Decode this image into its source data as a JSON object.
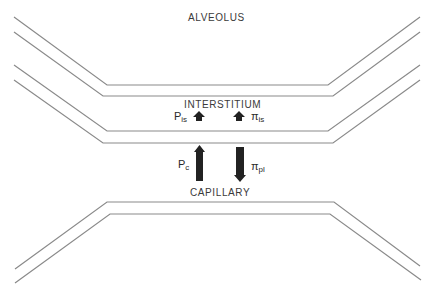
{
  "diagram": {
    "regions": {
      "alveolus": "ALVEOLUS",
      "interstitium": "INTERSTITIUM",
      "capillary": "CAPILLARY"
    },
    "forces": [
      {
        "symbol": "P",
        "subscript": "is",
        "direction": "up",
        "location": "interstitium",
        "arrow_size": "small"
      },
      {
        "symbol": "π",
        "subscript": "is",
        "direction": "up",
        "location": "interstitium",
        "arrow_size": "small"
      },
      {
        "symbol": "P",
        "subscript": "c",
        "direction": "up",
        "location": "capillary-wall",
        "arrow_size": "large"
      },
      {
        "symbol": "π",
        "subscript": "pl",
        "direction": "down",
        "location": "capillary-wall",
        "arrow_size": "large"
      }
    ],
    "colors": {
      "line": "#8a8a8a",
      "arrow": "#222222",
      "text": "#3a3a3a",
      "background": "#ffffff"
    }
  }
}
